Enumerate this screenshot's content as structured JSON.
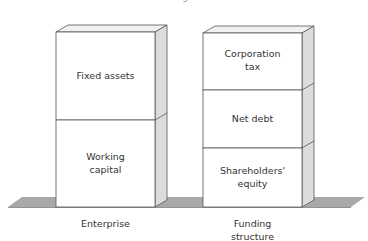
{
  "title_fragment": "g",
  "colors": {
    "ground": "#a9a9a9",
    "side_face": "#dcdcdc",
    "top_face": "#f1f1f1",
    "front_face": "#ffffff",
    "stroke": "#555555",
    "text": "#333333"
  },
  "blocks": [
    {
      "name": "enterprise",
      "label": "Enterprise",
      "segments": [
        {
          "label": "Fixed assets"
        },
        {
          "label": "Working\ncapital"
        }
      ]
    },
    {
      "name": "funding-structure",
      "label": "Funding\nstructure",
      "segments": [
        {
          "label": "Corporation\ntax"
        },
        {
          "label": "Net debt"
        },
        {
          "label": "Shareholders'\nequity"
        }
      ]
    }
  ]
}
